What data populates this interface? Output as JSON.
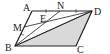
{
  "figure": {
    "type": "parallelogram",
    "labels": {
      "A": "A",
      "B": "B",
      "C": "C",
      "D": "D",
      "M": "M",
      "N": "N",
      "E": "E"
    },
    "shaded_region": "triangle BCD",
    "colors": {
      "stroke": "#222222",
      "shade": "#d9d9d9"
    }
  }
}
